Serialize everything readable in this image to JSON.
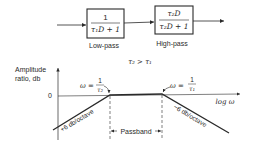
{
  "block_diagram": {
    "low_pass": {
      "numerator": "1",
      "denominator": "τ₁D + 1",
      "label": "Low-pass"
    },
    "high_pass": {
      "numerator": "τ₂D",
      "denominator": "τ₂D + 1",
      "label": "High-pass"
    },
    "condition": "τ₂ > τ₁"
  },
  "bode_plot": {
    "y_axis_label_line1": "Amplitude",
    "y_axis_label_line2": "ratio, db",
    "zero_label": "0",
    "x_axis_label": "log ω",
    "corner_low": {
      "prefix": "ω =",
      "numerator": "1",
      "denominator": "τ₂"
    },
    "corner_high": {
      "prefix": "ω =",
      "numerator": "1",
      "denominator": "τ₁"
    },
    "rising_slope_label": "+6 db/octave",
    "falling_slope_label": "−6 db/octave",
    "passband_label": "Passband"
  },
  "colors": {
    "ink": "#2a2a2a",
    "background": "#ffffff"
  }
}
